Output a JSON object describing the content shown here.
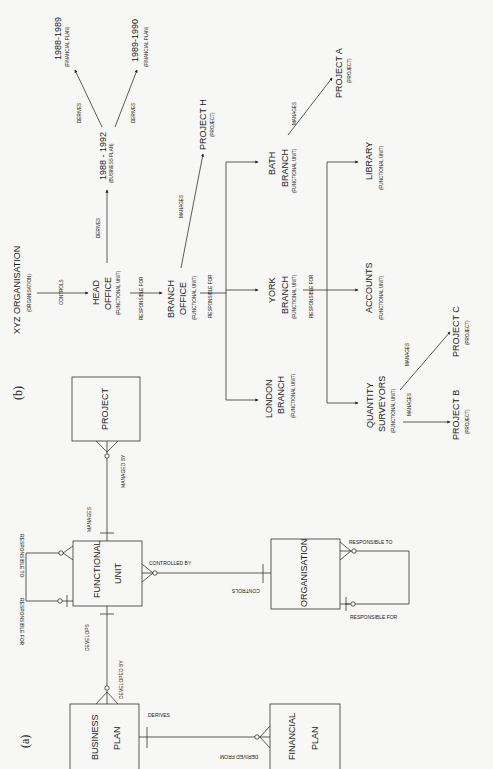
{
  "panel_a": {
    "label": "(a)",
    "entities": {
      "project": "PROJECT",
      "functional_unit_1": "FUNCTIONAL",
      "functional_unit_2": "UNIT",
      "organisation": "ORGANISATION",
      "business_plan_1": "BUSINESS",
      "business_plan_2": "PLAN",
      "financial_plan_1": "FINANCIAL",
      "financial_plan_2": "PLAN"
    },
    "relationships": {
      "manages": "MANAGES",
      "managed_by": "MANAGED BY",
      "fu_responsible_to": "RESPONSIBLE TO",
      "fu_responsible_for": "RESPONSIBLE FOR",
      "controlled_by": "CONTROLLED BY",
      "controls": "CONTROLS",
      "org_responsible_to": "RESPONSIBLE TO",
      "org_responsible_for": "RESPONSIBLE FOR",
      "develops": "DEVELOPS",
      "developed_by": "DEVELOPED BY",
      "derives": "DERIVES",
      "derived_from": "DERIVED FROM"
    }
  },
  "panel_b": {
    "label": "(b)",
    "nodes": {
      "xyz": {
        "name": "XYZ ORGANISATION",
        "type": "(ORGANISATION)"
      },
      "head_office": {
        "name1": "HEAD",
        "name2": "OFFICE",
        "type": "(FUNCTIONAL UNIT)"
      },
      "bplan": {
        "name": "1988 - 1992",
        "type": "(BUSINESS PLAN)"
      },
      "fp1": {
        "name": "1988-1989",
        "type": "(FINANCIAL PLAN)"
      },
      "fp2": {
        "name": "1989-1990",
        "type": "(FINANCIAL PLAN)"
      },
      "branch_office": {
        "name1": "BRANCH",
        "name2": "OFFICE",
        "type": "(FUNCTIONAL UNIT)"
      },
      "project_h": {
        "name": "PROJECT H",
        "type": "(PROJECT)"
      },
      "bath": {
        "name1": "BATH",
        "name2": "BRANCH",
        "type": "(FUNCTIONAL UNIT)"
      },
      "york": {
        "name1": "YORK",
        "name2": "BRANCH",
        "type": "(FUNCTIONAL UNIT)"
      },
      "london": {
        "name1": "LONDON",
        "name2": "BRANCH",
        "type": "(FUNCTIONAL UNIT)"
      },
      "project_a": {
        "name": "PROJECT A",
        "type": "(PROJECT)"
      },
      "library": {
        "name": "LIBRARY",
        "type": "(FUNCTIONAL UNIT)"
      },
      "accounts": {
        "name": "ACCOUNTS",
        "type": "(FUNCTIONAL UNIT)"
      },
      "qs": {
        "name1": "QUANTITY",
        "name2": "SURVEYORS",
        "type": "(FUNCTIONAL UNIT)"
      },
      "project_b": {
        "name": "PROJECT B",
        "type": "(PROJECT)"
      },
      "project_c": {
        "name": "PROJECT C",
        "type": "(PROJECT)"
      }
    },
    "edges": {
      "controls": "CONTROLS",
      "ho_derives": "DERIVES",
      "bp_derives_1": "DERIVES",
      "bp_derives_2": "DERIVES",
      "ho_responsible_for": "RESPONSIBLE FOR",
      "bo_manages": "MANAGES",
      "bo_responsible_for": "RESPONSIBLE FOR",
      "bath_manages": "MANAGES",
      "york_responsible_for": "RESPONSIBLE FOR",
      "qs_manages_c": "MANAGES",
      "qs_manages_b": "MANAGES"
    }
  }
}
